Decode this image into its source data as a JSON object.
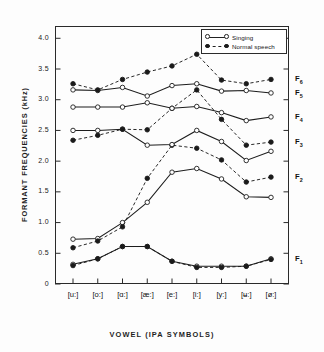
{
  "chart_data": {
    "type": "line",
    "title": "",
    "xlabel": "VOWEL  (IPA SYMBOLS)",
    "ylabel": "FORMANT  FREQUENCIES   (kHz)",
    "categories": [
      "[u:]",
      "[o:]",
      "[ɑ:]",
      "[æ:]",
      "[e:]",
      "[i:]",
      "[y:]",
      "[ʉ:]",
      "[ø:]"
    ],
    "ylim": [
      0,
      4.2
    ],
    "yticks": [
      "0",
      "0.5",
      "1.0",
      "1.5",
      "2.0",
      "2.5",
      "3.0",
      "3.5",
      "4.0"
    ],
    "ytick_values": [
      0,
      0.5,
      1.0,
      1.5,
      2.0,
      2.5,
      3.0,
      3.5,
      4.0
    ],
    "grid": false,
    "legend_position": "top-right",
    "legend": [
      {
        "label": "Singing",
        "style": "solid",
        "marker": "open-circle"
      },
      {
        "label": "Normal speech",
        "style": "dashed",
        "marker": "filled-circle"
      }
    ],
    "formant_labels": [
      "F₆",
      "F₅",
      "F₄",
      "F₃",
      "F₂",
      "F₁"
    ],
    "series": [
      {
        "name": "F1 Singing",
        "formant": "F1",
        "condition": "Singing",
        "style": "solid",
        "marker": "open-circle",
        "values": [
          0.32,
          0.41,
          0.61,
          0.61,
          0.37,
          0.29,
          0.29,
          0.29,
          0.41
        ]
      },
      {
        "name": "F1 Normal speech",
        "formant": "F1",
        "condition": "Normal speech",
        "style": "dashed",
        "marker": "filled-circle",
        "values": [
          0.3,
          0.41,
          0.61,
          0.61,
          0.37,
          0.27,
          0.27,
          0.29,
          0.4
        ]
      },
      {
        "name": "F2 Singing",
        "formant": "F2",
        "condition": "Singing",
        "style": "solid",
        "marker": "open-circle",
        "values": [
          0.73,
          0.74,
          1.0,
          1.33,
          1.82,
          1.88,
          1.71,
          1.42,
          1.41
        ]
      },
      {
        "name": "F2 Normal speech",
        "formant": "F2",
        "condition": "Normal speech",
        "style": "dashed",
        "marker": "filled-circle",
        "values": [
          0.59,
          0.7,
          0.93,
          1.72,
          2.26,
          2.21,
          2.02,
          1.66,
          1.74
        ]
      },
      {
        "name": "F3 Singing",
        "formant": "F3",
        "condition": "Singing",
        "style": "solid",
        "marker": "open-circle",
        "values": [
          2.5,
          2.5,
          2.52,
          2.26,
          2.27,
          2.5,
          2.32,
          2.01,
          2.16
        ]
      },
      {
        "name": "F3 Normal speech",
        "formant": "F3",
        "condition": "Normal speech",
        "style": "dashed",
        "marker": "filled-circle",
        "values": [
          2.34,
          2.42,
          2.52,
          2.51,
          2.86,
          3.16,
          2.68,
          2.26,
          2.31
        ]
      },
      {
        "name": "F4 Singing",
        "formant": "F4",
        "condition": "Singing",
        "style": "solid",
        "marker": "open-circle",
        "values": [
          2.88,
          2.88,
          2.88,
          2.95,
          2.86,
          2.89,
          2.79,
          2.66,
          2.72
        ]
      },
      {
        "name": "F5 Singing",
        "formant": "F5",
        "condition": "Singing",
        "style": "solid",
        "marker": "open-circle",
        "values": [
          3.16,
          3.15,
          3.2,
          3.06,
          3.23,
          3.26,
          3.14,
          3.15,
          3.11
        ]
      },
      {
        "name": "F6 Normal speech",
        "formant": "F6",
        "condition": "Normal speech",
        "style": "dashed",
        "marker": "filled-circle",
        "values": [
          3.26,
          3.16,
          3.33,
          3.45,
          3.55,
          3.74,
          3.32,
          3.26,
          3.33
        ]
      }
    ]
  },
  "axis": {
    "y_title": "FORMANT  FREQUENCIES   (kHz)",
    "x_title": "VOWEL  (IPA SYMBOLS)"
  },
  "colors": {
    "ink": "#1a1a1a",
    "frame": "#2a2a2a",
    "background": "#fdfdfd"
  }
}
